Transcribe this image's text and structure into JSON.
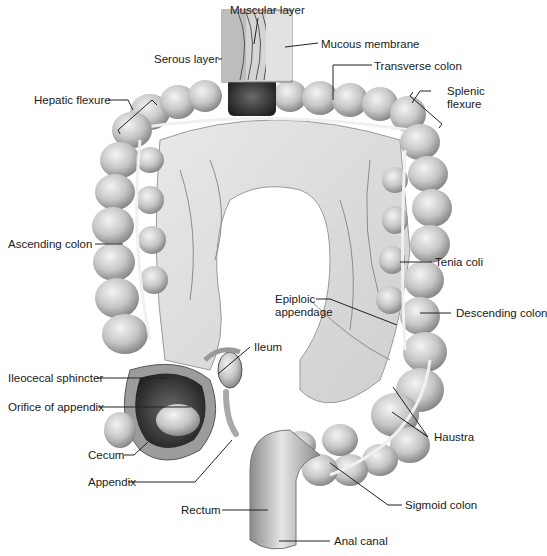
{
  "diagram": {
    "colors": {
      "background": "#ffffff",
      "tissue_light": "#d9d9d9",
      "tissue_mid": "#a8a8a8",
      "tissue_dark": "#3a3a3a",
      "leader_line": "#222222",
      "text": "#1a1a1a"
    },
    "labels": {
      "muscular_layer": "Muscular layer",
      "mucous_membrane": "Mucous membrane",
      "serous_layer": "Serous layer",
      "transverse_colon": "Transverse colon",
      "hepatic_flexure": "Hepatic flexure",
      "splenic_flexure_1": "Splenic",
      "splenic_flexure_2": "flexure",
      "ascending_colon": "Ascending colon",
      "tenia_coli": "Tenia coli",
      "epiploic_appendage_1": "Epiploic",
      "epiploic_appendage_2": "appendage",
      "descending_colon": "Descending colon",
      "ileum": "Ileum",
      "ileocecal_sphincter": "Ileocecal sphincter",
      "orifice_of_appendix": "Orifice of appendix",
      "haustra": "Haustra",
      "cecum": "Cecum",
      "appendix": "Appendix",
      "sigmoid_colon": "Sigmoid colon",
      "rectum": "Rectum",
      "anal_canal": "Anal canal"
    }
  }
}
